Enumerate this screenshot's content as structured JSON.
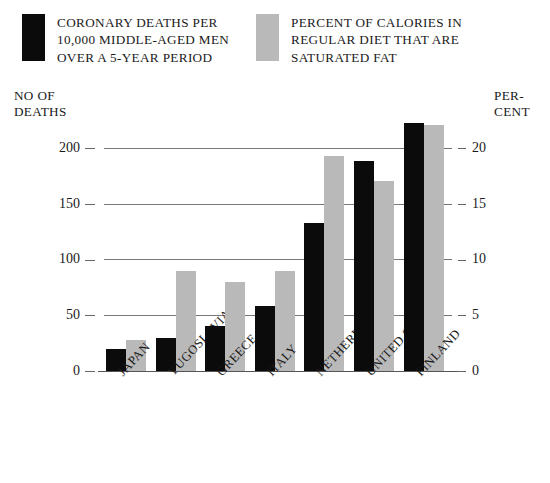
{
  "legend": {
    "series": [
      {
        "swatch": "black",
        "color": "#0b0b0b",
        "label": "Coronary deaths per\n10,000 middle-aged men\nover a 5-year period"
      },
      {
        "swatch": "gray",
        "color": "#b9b9b9",
        "label": "Percent of calories in\nregular diet that are\nsaturated fat"
      }
    ]
  },
  "axes": {
    "left_caption": "No of\nDeaths",
    "right_caption": "Per-\ncent",
    "left_ticks": [
      "200",
      "150",
      "100",
      "50",
      "0"
    ],
    "right_ticks": [
      "20",
      "15",
      "10",
      "5",
      "0"
    ]
  },
  "chart_data": {
    "type": "bar",
    "title": "",
    "categories": [
      "Japan",
      "Yugoslavia",
      "Greece",
      "Italy",
      "Netherlands",
      "United States",
      "Finland"
    ],
    "series": [
      {
        "name": "Coronary deaths per 10,000 middle-aged men over a 5-year period",
        "color": "#0b0b0b",
        "axis": "left",
        "values": [
          20,
          30,
          40,
          58,
          133,
          188,
          222
        ]
      },
      {
        "name": "Percent of calories in regular diet that are saturated fat",
        "color": "#b9b9b9",
        "axis": "right",
        "values": [
          2.8,
          9.0,
          8.0,
          9.0,
          19.3,
          17.0,
          22.0
        ]
      }
    ],
    "xlabel": "",
    "ylabel": "No of Deaths",
    "ylabel_right": "Percent",
    "ylim": [
      0,
      232
    ],
    "ylim_right": [
      0,
      23.2
    ],
    "yticks": [
      0,
      50,
      100,
      150,
      200
    ],
    "yticks_right": [
      0,
      5,
      10,
      15,
      20
    ],
    "grid": true,
    "legend_position": "top"
  }
}
